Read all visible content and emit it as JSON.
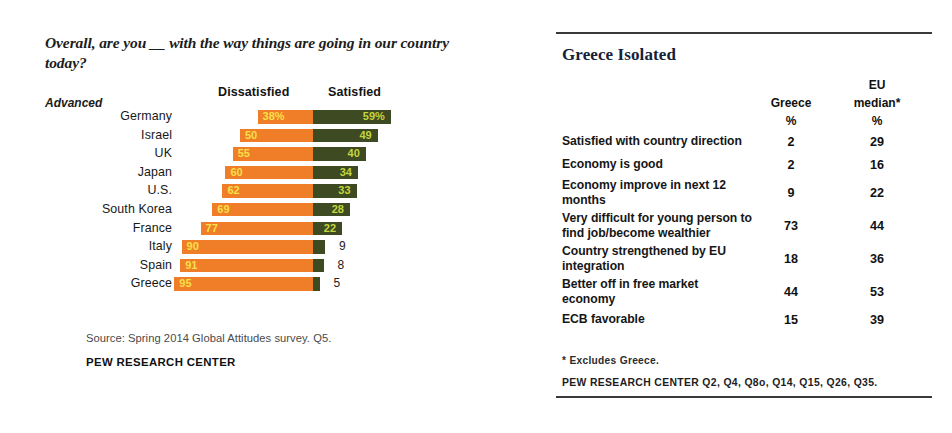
{
  "left_panel": {
    "question_title": "Overall, are you __ with the way things are going in our country today?",
    "group_label": "Advanced",
    "headers": {
      "dissatisfied": "Dissatisfied",
      "satisfied": "Satisfied"
    },
    "source_note": "Source: Spring 2014 Global Attitudes survey. Q5.",
    "pew_label": "PEW RESEARCH CENTER"
  },
  "right_panel": {
    "title": "Greece Isolated",
    "headers": {
      "eu_top": "EU",
      "greece": "Greece",
      "eu_median": "median*",
      "pct_greece": "%",
      "pct_eu": "%"
    },
    "rows": [
      {
        "label": "Satisfied with country direction",
        "greece": "2",
        "eu": "29",
        "lines": 1
      },
      {
        "label": "Economy is good",
        "greece": "2",
        "eu": "16",
        "lines": 1
      },
      {
        "label": "Economy improve in next 12 months",
        "greece": "9",
        "eu": "22",
        "lines": 2
      },
      {
        "label": "Very difficult for young person to find job/become wealthier",
        "greece": "73",
        "eu": "44",
        "lines": 2
      },
      {
        "label": "Country strengthened by EU integration",
        "greece": "18",
        "eu": "36",
        "lines": 2
      },
      {
        "label": "Better off in free market economy",
        "greece": "44",
        "eu": "53",
        "lines": 2
      },
      {
        "label": "ECB favorable",
        "greece": "15",
        "eu": "39",
        "lines": 1
      }
    ],
    "footnote": "* Excludes Greece.",
    "pew_label": "PEW RESEARCH CENTER Q2, Q4, Q8o, Q14, Q15, Q26, Q35."
  },
  "colors": {
    "dissatisfied_bar": "#F07D28",
    "satisfied_bar": "#3E4A22",
    "dissatisfied_text": "#F7E04A",
    "satisfied_text": "#C3D63C",
    "outside_text": "#222222",
    "title_color": "#15213A"
  },
  "chart_data": {
    "type": "bar",
    "title": "Overall, are you __ with the way things are going in our country today?",
    "subtitle": "Advanced",
    "xlabel": "",
    "ylabel": "",
    "orientation": "horizontal",
    "stacked": "diverging",
    "grid": false,
    "legend_position": "top",
    "categories": [
      "Germany",
      "Israel",
      "UK",
      "Japan",
      "U.S.",
      "South Korea",
      "France",
      "Italy",
      "Spain",
      "Greece"
    ],
    "series": [
      {
        "name": "Dissatisfied",
        "color": "#F07D28",
        "values": [
          38,
          50,
          55,
          60,
          62,
          69,
          77,
          90,
          91,
          95
        ],
        "labels": [
          "38%",
          "50",
          "55",
          "60",
          "62",
          "69",
          "77",
          "90",
          "91",
          "95"
        ]
      },
      {
        "name": "Satisfied",
        "color": "#3E4A22",
        "values": [
          59,
          49,
          40,
          34,
          33,
          28,
          22,
          9,
          8,
          5
        ],
        "labels": [
          "59%",
          "49",
          "40",
          "34",
          "33",
          "28",
          "22",
          "9",
          "8",
          "5"
        ]
      }
    ],
    "units": "percent",
    "px_per_unit_dissatisfied": 1.46,
    "px_per_unit_satisfied": 1.32,
    "label_inside_threshold": 20
  }
}
